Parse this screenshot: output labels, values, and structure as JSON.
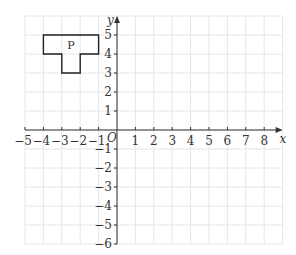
{
  "chart_data": {
    "type": "coordinate-grid",
    "title": "",
    "xlabel": "x",
    "ylabel": "y",
    "origin_label": "O",
    "xlim": [
      -5,
      9
    ],
    "ylim": [
      -6,
      6
    ],
    "grid": true,
    "x_ticks": [
      -5,
      -4,
      -3,
      -2,
      -1,
      1,
      2,
      3,
      4,
      5,
      6,
      7,
      8
    ],
    "y_ticks": [
      -6,
      -5,
      -4,
      -3,
      -2,
      -1,
      1,
      2,
      3,
      4,
      5
    ],
    "shapes": [
      {
        "label": "P",
        "label_position": [
          -2.5,
          4.5
        ],
        "vertices": [
          [
            -4,
            5
          ],
          [
            -1,
            5
          ],
          [
            -1,
            4
          ],
          [
            -2,
            4
          ],
          [
            -2,
            3
          ],
          [
            -3,
            3
          ],
          [
            -3,
            4
          ],
          [
            -4,
            4
          ]
        ]
      }
    ]
  },
  "colors": {
    "grid": "#e6e6e6",
    "axis": "#333333",
    "shape": "#222222"
  }
}
